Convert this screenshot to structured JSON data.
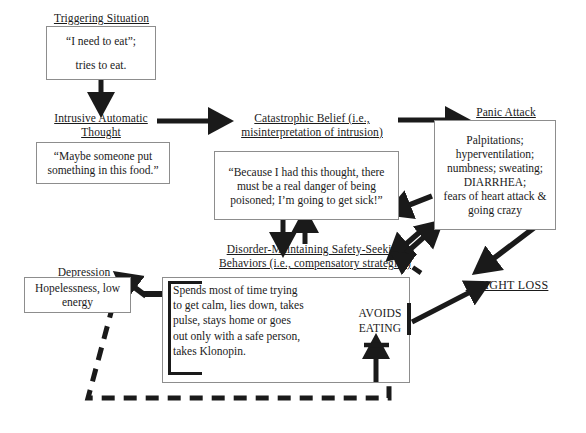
{
  "diagram": {
    "nodes": {
      "triggering": {
        "header": "Triggering Situation",
        "line1": "“I need to eat”;",
        "line2": "tries to eat."
      },
      "intrusive": {
        "header_line1": "Intrusive Automatic",
        "header_line2": "Thought",
        "line1": "“Maybe someone put",
        "line2": "something in this food.”"
      },
      "catastrophic": {
        "header_line1": "Catastrophic Belief (i.e.,",
        "header_line2": "misinterpretation of intrusion)",
        "line1": "“Because I had this thought, there",
        "line2": "must be a real danger of being",
        "line3": "poisoned; I’m going to get sick!”"
      },
      "panic": {
        "header": "Panic Attack",
        "line1": "Palpitations;",
        "line2": "hyperventilation;",
        "line3": "numbness; sweating;",
        "line4": "DIARRHEA;",
        "line5": "fears of heart attack &",
        "line6": "going crazy"
      },
      "behaviors": {
        "header_line1": "Disorder-Maintaining Safety-Seeking",
        "header_line2": "Behaviors (i.e., compensatory strategies)",
        "line1": "Spends most of time trying",
        "line2": "to get calm, lies down, takes",
        "line3": "pulse, stays home or goes",
        "line4": "out only with a safe person,",
        "line5": "takes Klonopin."
      },
      "avoids": {
        "line1": "AVOIDS",
        "line2": "EATING"
      },
      "depression": {
        "header": "Depression",
        "line1": "Hopelessness, low",
        "line2": "energy"
      },
      "weightloss": {
        "label": "WEIGHT LOSS"
      }
    },
    "edges": [
      {
        "name": "triggering-to-intrusive",
        "style": "solid",
        "direction": "down"
      },
      {
        "name": "intrusive-to-catastrophic",
        "style": "solid",
        "direction": "right"
      },
      {
        "name": "catastrophic-to-panic",
        "style": "solid",
        "direction": "right"
      },
      {
        "name": "catastrophic-to-behaviors",
        "style": "solid",
        "direction": "down"
      },
      {
        "name": "behaviors-to-catastrophic",
        "style": "solid",
        "direction": "up"
      },
      {
        "name": "panic-to-catastrophic",
        "style": "solid",
        "direction": "down-left"
      },
      {
        "name": "panic-to-behaviors",
        "style": "solid",
        "direction": "down-left"
      },
      {
        "name": "behaviors-to-panic",
        "style": "solid",
        "direction": "up-right"
      },
      {
        "name": "weightloss-to-behaviors",
        "style": "dashed",
        "direction": "up-left"
      },
      {
        "name": "panic-to-weightloss",
        "style": "solid",
        "direction": "down-right"
      },
      {
        "name": "avoids-to-weightloss",
        "style": "solid",
        "direction": "up-right"
      },
      {
        "name": "behaviors-to-depression",
        "style": "solid",
        "direction": "up-left"
      },
      {
        "name": "depression-to-avoids",
        "style": "dashed",
        "direction": "down-right"
      }
    ],
    "colors": {
      "ink": "#1a1a1a",
      "box_border": "#8d8d8d",
      "background": "#ffffff"
    }
  }
}
